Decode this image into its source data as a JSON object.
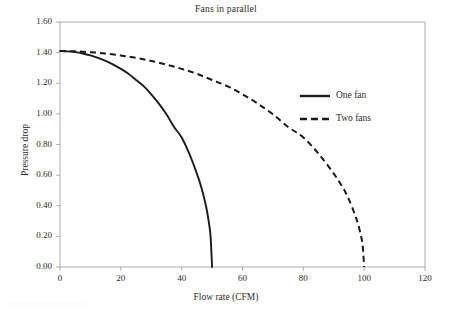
{
  "chart_data": {
    "type": "line",
    "title": "Fans in parallel",
    "xlabel": "Flow rate (CFM)",
    "ylabel": "Pressure drop",
    "xlim": [
      0,
      120
    ],
    "ylim": [
      0,
      1.6
    ],
    "xticks": [
      "0",
      "20",
      "40",
      "60",
      "80",
      "100",
      "120"
    ],
    "xtick_values": [
      0,
      20,
      40,
      60,
      80,
      100,
      120
    ],
    "yticks": [
      "0.00",
      "0.20",
      "0.40",
      "0.60",
      "0.80",
      "1.00",
      "1.20",
      "1.40",
      "1.60"
    ],
    "ytick_values": [
      0.0,
      0.2,
      0.4,
      0.6,
      0.8,
      1.0,
      1.2,
      1.4,
      1.6
    ],
    "grid": false,
    "legend_position": "upper right",
    "series": [
      {
        "name": "One fan",
        "style": "solid",
        "color": "#1a1a1a",
        "x": [
          0,
          2.5,
          5,
          7.5,
          10,
          12.5,
          15,
          17.5,
          20,
          22.5,
          25,
          27.5,
          30,
          32.5,
          35,
          37.5,
          40,
          42.5,
          45,
          46.5,
          48,
          49,
          49.5,
          50
        ],
        "y": [
          1.41,
          1.4082,
          1.4029,
          1.3941,
          1.3817,
          1.3656,
          1.3457,
          1.3218,
          1.2939,
          1.2617,
          1.2211,
          1.181,
          1.128,
          1.0673,
          0.9972,
          0.9147,
          0.846,
          0.74,
          0.61,
          0.518,
          0.398,
          0.2829,
          0.2,
          0.0
        ]
      },
      {
        "name": "Two fans",
        "style": "dashed",
        "color": "#1a1a1a",
        "x": [
          0,
          5,
          10,
          15,
          20,
          25,
          30,
          35,
          40,
          45,
          50,
          55,
          60,
          65,
          70,
          75,
          80,
          85,
          90,
          93,
          95,
          97,
          98,
          99,
          99.5,
          100
        ],
        "y": [
          1.41,
          1.4082,
          1.4029,
          1.3941,
          1.3817,
          1.3656,
          1.3457,
          1.3218,
          1.2939,
          1.2617,
          1.2211,
          1.181,
          1.128,
          1.0673,
          0.9972,
          0.9147,
          0.846,
          0.74,
          0.61,
          0.518,
          0.44,
          0.34,
          0.28,
          0.199,
          0.141,
          0.0
        ]
      }
    ]
  },
  "legend": {
    "items": [
      {
        "label": "One fan"
      },
      {
        "label": "Two fans"
      }
    ]
  }
}
